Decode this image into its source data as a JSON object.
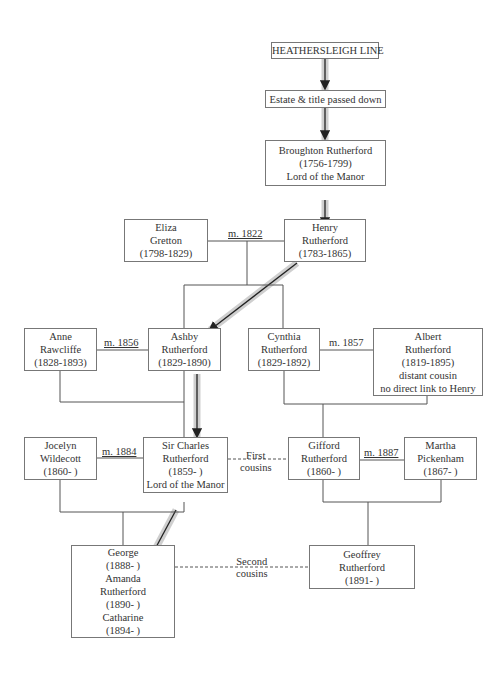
{
  "title_cut": "Rutherford family tree",
  "nodes": {
    "line": {
      "lines": [
        "HEATHERSLEIGH LINE"
      ]
    },
    "estate": {
      "lines": [
        "Estate & title passed down"
      ]
    },
    "broughton": {
      "lines": [
        "Broughton Rutherford",
        "(1756-1799)",
        "Lord of the Manor"
      ]
    },
    "eliza": {
      "lines": [
        "Eliza",
        "Gretton",
        "(1798-1829)"
      ]
    },
    "henry": {
      "lines": [
        "Henry",
        "Rutherford",
        "(1783-1865)"
      ]
    },
    "anne": {
      "lines": [
        "Anne",
        "Rawcliffe",
        "(1828-1893)"
      ]
    },
    "ashby": {
      "lines": [
        "Ashby",
        "Rutherford",
        "(1829-1890)"
      ]
    },
    "cynthia": {
      "lines": [
        "Cynthia",
        "Rutherford",
        "(1829-1892)"
      ]
    },
    "albert": {
      "lines": [
        "Albert",
        "Rutherford",
        "(1819-1895)",
        "distant cousin",
        "no direct link to Henry"
      ]
    },
    "jocelyn": {
      "lines": [
        "Jocelyn",
        "Wildecott",
        "(1860-      )"
      ]
    },
    "charles": {
      "lines": [
        "Sir Charles",
        "Rutherford",
        "(1859-      )",
        "Lord of the Manor"
      ]
    },
    "gifford": {
      "lines": [
        "Gifford",
        "Rutherford",
        "(1860-      )"
      ]
    },
    "martha": {
      "lines": [
        "Martha",
        "Pickenham",
        "(1867-      )"
      ]
    },
    "children": {
      "lines": [
        "George",
        "(1888-      )",
        "Amanda",
        "Rutherford",
        "(1890-    )",
        "Catharine",
        "(1894-    )"
      ]
    },
    "geoffrey": {
      "lines": [
        "Geoffrey",
        "Rutherford",
        "(1891-    )"
      ]
    }
  },
  "labels": {
    "m1822": "m. 1822",
    "m1856": "m. 1856",
    "m1857": "m. 1857",
    "m1884": "m. 1884",
    "m1887": "m. 1887",
    "first_cousins": [
      "First",
      "cousins"
    ],
    "second_cousins": [
      "Second",
      "cousins"
    ]
  },
  "colors": {
    "line": "#555555",
    "highlight": "#cccccc",
    "arrow": "#222222"
  }
}
